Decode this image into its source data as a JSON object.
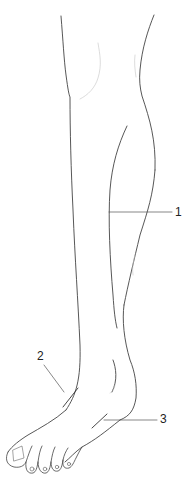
{
  "figure": {
    "colors": {
      "outline": "#444444",
      "faint": "#bbbbbb",
      "leader": "#555555",
      "background": "#ffffff"
    }
  },
  "callouts": [
    {
      "id": 1,
      "label": "1",
      "x": 175,
      "y": 206
    },
    {
      "id": 2,
      "label": "2",
      "x": 37,
      "y": 350
    },
    {
      "id": 3,
      "label": "3",
      "x": 160,
      "y": 413
    }
  ]
}
